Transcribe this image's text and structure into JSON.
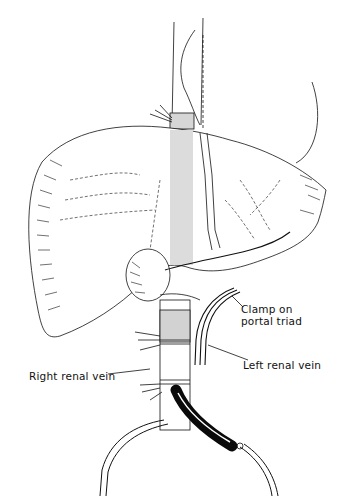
{
  "figure": {
    "labels": {
      "clamp_line1": "Clamp on",
      "clamp_line2": "portal triad",
      "left_renal_vein": "Left renal vein",
      "right_renal_vein": "Right renal vein"
    },
    "colors": {
      "ink": "#111111",
      "background": "#ffffff",
      "shading": "#c8c8c8",
      "cannula": "#0a0a0a"
    }
  }
}
